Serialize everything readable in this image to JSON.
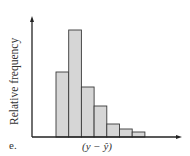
{
  "chart_data": {
    "type": "bar",
    "title": "",
    "panel_label": "e.",
    "xlabel": "(y − ŷ)",
    "ylabel": "Relative frequency",
    "categories": [
      "bin1",
      "bin2",
      "bin3",
      "bin4",
      "bin5",
      "bin6",
      "bin7"
    ],
    "values": [
      65,
      107,
      50,
      31,
      13,
      8,
      5
    ],
    "grid": false,
    "legend": null,
    "ticks": "none",
    "colors": {
      "bar_fill": "#d6d6d6",
      "bar_stroke": "#3a3a3a",
      "axis": "#222222"
    }
  }
}
